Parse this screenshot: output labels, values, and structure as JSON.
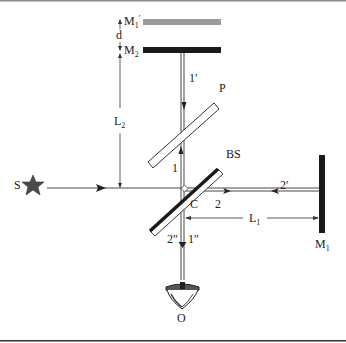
{
  "diagram": {
    "colors": {
      "mirror": "#1a1a1a",
      "virtual_mirror": "#9a9a9a",
      "beam": "#333333",
      "star": "#4a4a4a",
      "frame_top": "#8a8a8a",
      "frame_bottom": "#333333"
    },
    "labels": {
      "source": "S",
      "mirror_m1_prime": "M",
      "mirror_m1_prime_sub": "1",
      "mirror_m1_prime_mark": "′",
      "distance_d": "d",
      "mirror_m2": "M",
      "mirror_m2_sub": "2",
      "beam_1_prime": "1′",
      "compensator": "P",
      "length_l2": "L",
      "length_l2_sub": "2",
      "beam_1": "1",
      "beam_splitter": "BS",
      "beam_2_prime": "2′",
      "point_c": "C",
      "beam_2": "2",
      "length_l1": "L",
      "length_l1_sub": "1",
      "mirror_m1": "M",
      "mirror_m1_sub": "1",
      "beam_2_dprime": "2″",
      "beam_1_dprime": "1″",
      "observer": "O"
    }
  }
}
